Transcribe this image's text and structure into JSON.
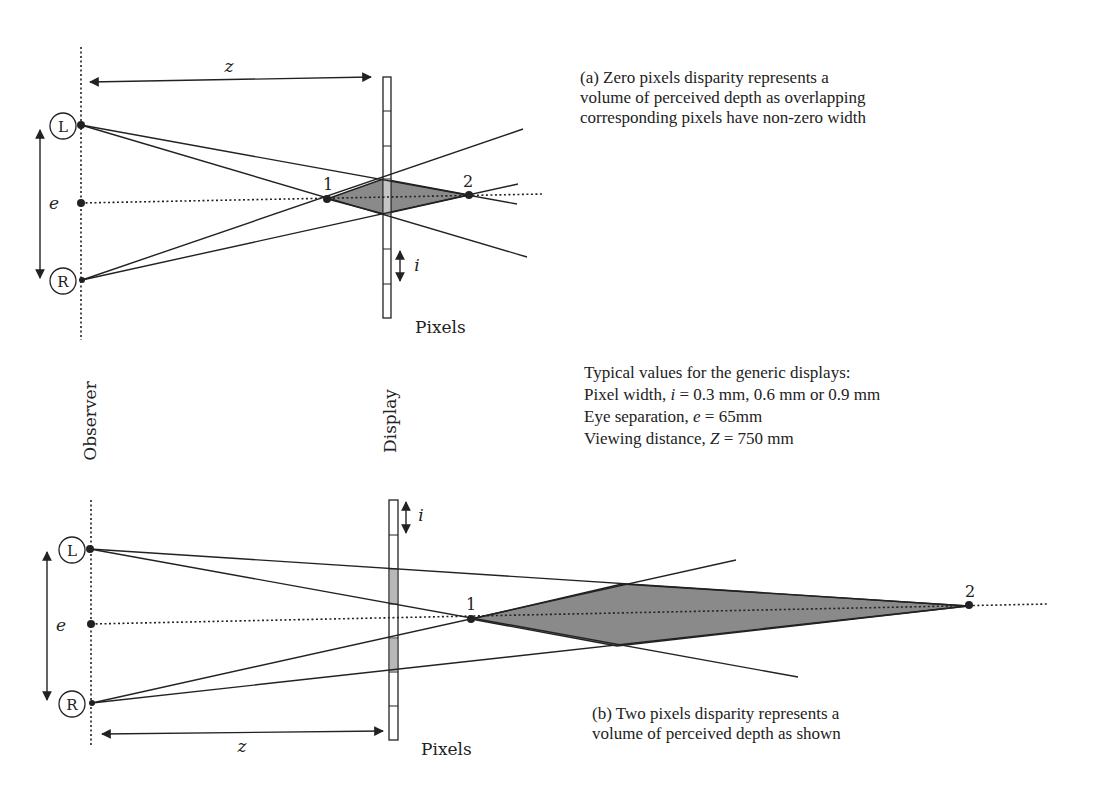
{
  "diagram_a": {
    "caption_lines": [
      "(a) Zero pixels disparity represents a",
      "volume of perceived depth as overlapping",
      "corresponding pixels have non-zero width"
    ],
    "labels": {
      "z": "z",
      "e": "e",
      "i": "i",
      "left_eye": "L",
      "right_eye": "R",
      "point_1": "1",
      "point_2": "2",
      "pixels": "Pixels"
    }
  },
  "axis_labels": {
    "observer": "Observer",
    "display": "Display"
  },
  "typical_values": {
    "heading": "Typical values for the generic displays:",
    "pixel_width_prefix": "Pixel width, ",
    "pixel_width_var": "i",
    "pixel_width_value": " = 0.3 mm, 0.6 mm or 0.9 mm",
    "eye_sep_prefix": "Eye separation, ",
    "eye_sep_var": "e",
    "eye_sep_value": " = 65mm",
    "view_dist_prefix": "Viewing distance, ",
    "view_dist_var": "Z",
    "view_dist_value": " = 750 mm"
  },
  "diagram_b": {
    "caption_lines": [
      "(b) Two pixels disparity represents a",
      "volume of perceived depth as shown"
    ],
    "labels": {
      "z": "z",
      "e": "e",
      "i": "i",
      "left_eye": "L",
      "right_eye": "R",
      "point_1": "1",
      "point_2": "2",
      "pixels": "Pixels"
    }
  },
  "colors": {
    "line": "#222222",
    "depth_fill": "#8a8a8a",
    "pixel_fill": "#b8b8b8",
    "background": "#ffffff"
  }
}
